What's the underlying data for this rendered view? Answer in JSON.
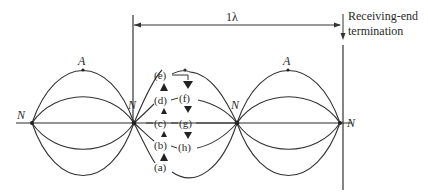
{
  "diagram": {
    "title_span_label": "1λ",
    "termination_label_line1": "Receiving-end",
    "termination_label_line2": "termination",
    "node_label": "N",
    "antinode_label": "A",
    "nodes": [
      {
        "label": "N",
        "x": 32
      },
      {
        "label": "N",
        "x": 134
      },
      {
        "label": "N",
        "x": 237
      },
      {
        "label": "N",
        "x": 340
      }
    ],
    "antinodes": [
      {
        "label": "A",
        "x": 83
      },
      {
        "label": "A",
        "x": 288
      }
    ],
    "phase_labels_left": [
      "(e)",
      "(d)",
      "(c)",
      "(b)",
      "(a)"
    ],
    "phase_labels_right": [
      "(f)",
      "(g)",
      "(h)"
    ],
    "colors": {
      "line": "#333333",
      "background": "#ffffff"
    }
  }
}
